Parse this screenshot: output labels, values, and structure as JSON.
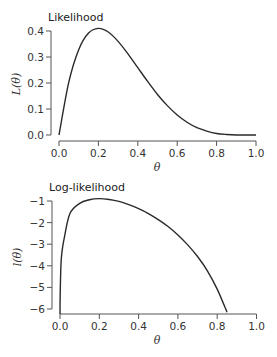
{
  "chart_data": [
    {
      "type": "line",
      "title": "Likelihood",
      "xlabel": "θ",
      "ylabel": "L(θ)",
      "xlim": [
        0.0,
        1.0
      ],
      "ylim": [
        0.0,
        0.4
      ],
      "xticks": [
        "0.0",
        "0.2",
        "0.4",
        "0.6",
        "0.8",
        "1.0"
      ],
      "yticks": [
        "0.0",
        "0.1",
        "0.2",
        "0.3",
        "0.4"
      ],
      "grid": false,
      "legend": null,
      "series": [
        {
          "name": "L(θ)",
          "x": [
            0.0,
            0.05,
            0.1,
            0.15,
            0.2,
            0.25,
            0.3,
            0.35,
            0.4,
            0.45,
            0.5,
            0.55,
            0.6,
            0.65,
            0.7,
            0.75,
            0.8,
            0.85,
            0.9,
            0.95,
            1.0
          ],
          "values": [
            0.0,
            0.204,
            0.328,
            0.392,
            0.41,
            0.396,
            0.36,
            0.312,
            0.259,
            0.206,
            0.156,
            0.113,
            0.077,
            0.049,
            0.028,
            0.015,
            0.006,
            0.002,
            0.0,
            0.0,
            0.0
          ]
        }
      ]
    },
    {
      "type": "line",
      "title": "Log-likelihood",
      "xlabel": "θ",
      "ylabel": "l(θ)",
      "xlim": [
        0.0,
        1.0
      ],
      "ylim": [
        -6.2,
        -0.8
      ],
      "xticks": [
        "0.0",
        "0.2",
        "0.4",
        "0.6",
        "0.8",
        "1.0"
      ],
      "yticks": [
        "−1",
        "−2",
        "−3",
        "−4",
        "−5",
        "−6"
      ],
      "grid": false,
      "legend": null,
      "series": [
        {
          "name": "l(θ)",
          "x": [
            0.001,
            0.005,
            0.01,
            0.02,
            0.05,
            0.1,
            0.15,
            0.2,
            0.25,
            0.3,
            0.35,
            0.4,
            0.45,
            0.5,
            0.55,
            0.6,
            0.65,
            0.7,
            0.75,
            0.8,
            0.85
          ],
          "values": [
            -5.3,
            -3.93,
            -3.36,
            -2.79,
            -1.59,
            -1.11,
            -0.94,
            -0.89,
            -0.93,
            -1.02,
            -1.17,
            -1.35,
            -1.58,
            -1.86,
            -2.18,
            -2.57,
            -3.03,
            -3.57,
            -4.23,
            -5.08,
            -6.15
          ]
        }
      ]
    }
  ],
  "charts": {
    "top": {
      "title": "Likelihood",
      "ylabel": "L(θ)",
      "xlabel": "θ",
      "xticks": [
        "0.0",
        "0.2",
        "0.4",
        "0.6",
        "0.8",
        "1.0"
      ],
      "yticks": [
        "0.0",
        "0.1",
        "0.2",
        "0.3",
        "0.4"
      ]
    },
    "bottom": {
      "title": "Log-likelihood",
      "ylabel": "l(θ)",
      "xlabel": "θ",
      "xticks": [
        "0.0",
        "0.2",
        "0.4",
        "0.6",
        "0.8",
        "1.0"
      ],
      "yticks": [
        "−1",
        "−2",
        "−3",
        "−4",
        "−5",
        "−6"
      ]
    }
  },
  "colors": {
    "curve": "#2a2a2a",
    "axis": "#555555",
    "text": "#333333"
  }
}
